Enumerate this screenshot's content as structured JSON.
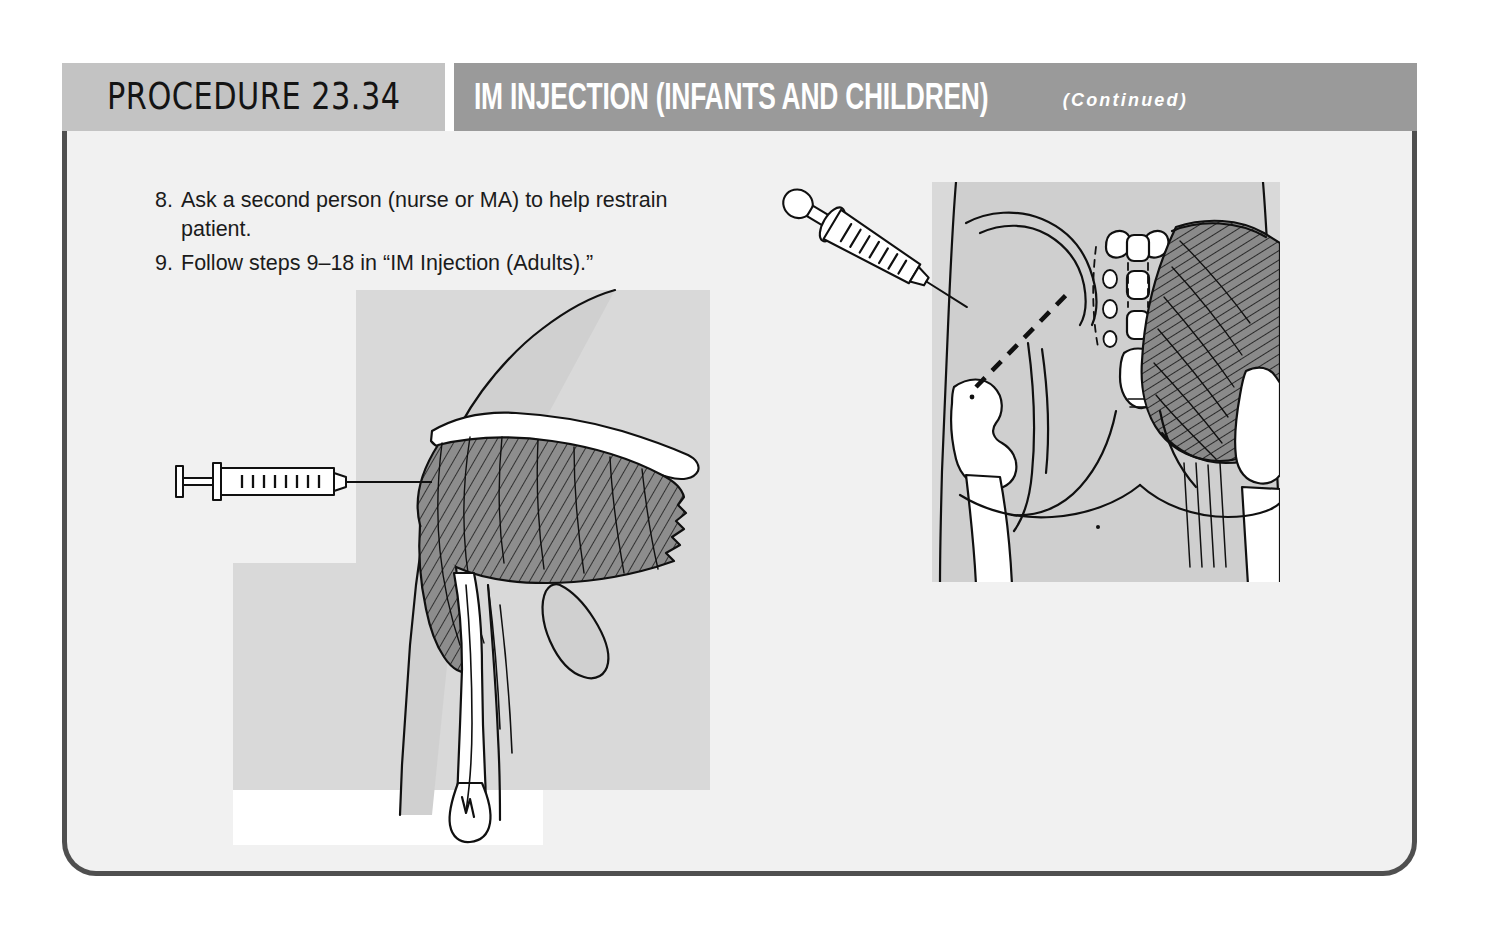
{
  "header": {
    "procedure_tab": "PROCEDURE 23.34",
    "title": "IM INJECTION (INFANTS AND CHILDREN)",
    "continued": "(Continued)"
  },
  "steps": [
    {
      "number": "8.",
      "text": "Ask a second person (nurse or MA) to help restrain patient."
    },
    {
      "number": "9.",
      "text": "Follow steps 9–18 in “IM Injection (Adults).”"
    }
  ],
  "figures": [
    {
      "name": "deltoid-injection-illustration",
      "caption": "",
      "description": "Anterior view of shoulder and upper arm showing clavicle, scapula, humerus and the deltoid muscle with a syringe entering the deltoid injection site from the left"
    },
    {
      "name": "gluteal-injection-illustration",
      "caption": "",
      "description": "Posterior view of the pelvis and buttocks showing iliac crest, sacrum, coccyx, greater trochanters and gluteal muscles, with an angled syringe and a dashed line marking the dorsogluteal injection landmark"
    }
  ],
  "colors": {
    "page_background": "#ffffff",
    "card_background": "#f1f1f1",
    "card_border": "#4f4f4f",
    "procedure_tab_background": "#c3c3c3",
    "title_bar_background": "#9a9a9a",
    "title_text": "#ffffff",
    "body_text": "#1b1b1b",
    "illustration_skin": "#d2d2d2",
    "illustration_muscle": "#8f8f8f",
    "illustration_bone": "#ffffff",
    "illustration_line": "#101010"
  }
}
